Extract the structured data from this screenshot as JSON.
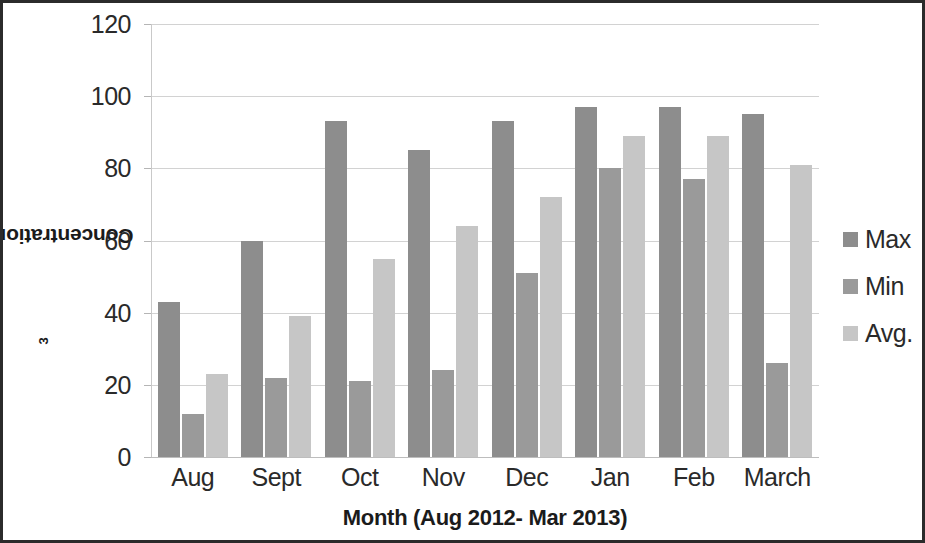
{
  "chart_data": {
    "type": "bar",
    "title": "",
    "xlabel": "Month (Aug 2012- Mar 2013)",
    "ylabel": "Concentration in µg/m³",
    "ylabel_main": "Concentration in µg/m",
    "ylabel_sup": "3",
    "categories": [
      "Aug",
      "Sept",
      "Oct",
      "Nov",
      "Dec",
      "Jan",
      "Feb",
      "March"
    ],
    "series": [
      {
        "name": "Max",
        "color": "#8d8d8d",
        "values": [
          43,
          60,
          93,
          85,
          93,
          97,
          97,
          95
        ]
      },
      {
        "name": "Min",
        "color": "#9a9a9a",
        "values": [
          12,
          22,
          21,
          24,
          51,
          80,
          77,
          26
        ]
      },
      {
        "name": "Avg.",
        "color": "#c6c6c6",
        "values": [
          23,
          39,
          55,
          64,
          72,
          89,
          89,
          81
        ]
      }
    ],
    "ylim": [
      0,
      120
    ],
    "yticks": [
      120,
      100,
      80,
      60,
      40,
      20,
      0
    ],
    "ytick_labels": [
      "120",
      "100",
      "80",
      "60",
      "40",
      "20",
      "0"
    ],
    "grid": true,
    "legend_position": "right",
    "border_color": "#2b2b2b",
    "gridline_color": "#d2d2d2",
    "background_color": "#ffffff"
  },
  "legend": {
    "items": [
      {
        "label": "Max"
      },
      {
        "label": "Min"
      },
      {
        "label": "Avg."
      }
    ]
  }
}
